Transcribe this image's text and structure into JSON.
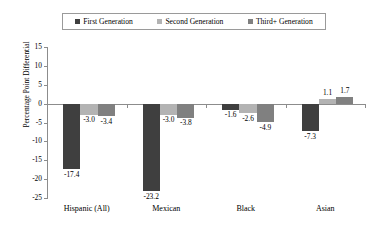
{
  "chart_data": {
    "type": "bar",
    "title": "",
    "xlabel": "",
    "ylabel": "Percentage Point Differential",
    "ylim": [
      -25,
      15
    ],
    "ytick_step": 5,
    "yticks": [
      15,
      10,
      5,
      0,
      -5,
      -10,
      -15,
      -20,
      -25
    ],
    "ytick_labels": [
      "15",
      "10",
      "5",
      "0",
      "-5",
      "-10",
      "-15",
      "-20",
      "-25"
    ],
    "grid": false,
    "legend_position": "top",
    "categories": [
      "Hispanic (All)",
      "Mexican",
      "Black",
      "Asian"
    ],
    "series": [
      {
        "name": "First Generation",
        "color": "#3f3f3f",
        "values": [
          -17.4,
          -23.2,
          -1.6,
          -7.3
        ],
        "labels": [
          "-17.4",
          "-23.2",
          "-1.6",
          "-7.3"
        ]
      },
      {
        "name": "Second Generation",
        "color": "#b3b3b3",
        "values": [
          -3.0,
          -3.0,
          -2.6,
          1.1
        ],
        "labels": [
          "-3.0",
          "-3.0",
          "-2.6",
          "1.1"
        ]
      },
      {
        "name": "Third+ Generation",
        "color": "#808080",
        "values": [
          -3.4,
          -3.8,
          -4.9,
          1.7
        ],
        "labels": [
          "-3.4",
          "-3.8",
          "-4.9",
          "1.7"
        ]
      }
    ]
  },
  "legend": {
    "items": [
      {
        "label": "First Generation",
        "marker": "square-marker-icon"
      },
      {
        "label": "Second Generation",
        "marker": "square-marker-icon"
      },
      {
        "label": "Third+ Generation",
        "marker": "square-marker-icon"
      }
    ]
  },
  "axis": {
    "y_title": "Percentage Point Differential"
  },
  "colors": {
    "first_generation": "#3f3f3f",
    "second_generation": "#b3b3b3",
    "third_generation": "#808080",
    "axis": "#8c8c8c",
    "background": "#ffffff"
  }
}
